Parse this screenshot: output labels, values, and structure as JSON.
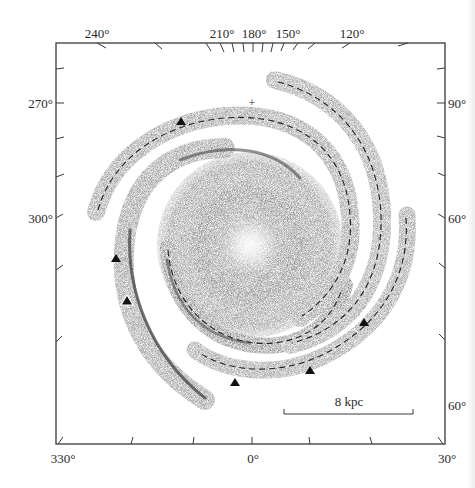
{
  "figure": {
    "title": "",
    "colors": {
      "frame": "#3a3a3a",
      "arm_fill": "#8e8e8e",
      "arm_dark": "#3c3c3c",
      "bulge_center": "#f4f4f4",
      "marker": "#111111",
      "background": "#ffffff"
    },
    "frame": {
      "left": 56,
      "top": 43,
      "right": 445,
      "bottom": 444
    },
    "axis_labels": {
      "top": [
        {
          "text": "240°",
          "x": 97
        },
        {
          "text": "210°",
          "x": 213
        },
        {
          "text": "180°",
          "x": 248
        },
        {
          "text": "150°",
          "x": 286
        },
        {
          "text": "120°",
          "x": 352
        }
      ],
      "left": [
        {
          "text": "270°",
          "y": 103
        },
        {
          "text": "300°",
          "y": 218
        }
      ],
      "right": [
        {
          "text": "90°",
          "y": 103
        },
        {
          "text": "60°",
          "y": 218
        },
        {
          "text": "60°",
          "y": 405
        }
      ],
      "bottom": [
        {
          "text": "330°",
          "x": 62
        },
        {
          "text": "0°",
          "x": 252
        },
        {
          "text": "30°",
          "x": 445
        }
      ]
    },
    "scale_bar": {
      "label": "8 kpc",
      "x1": 284,
      "x2": 413,
      "y": 414
    },
    "sun_marker": {
      "symbol": "+",
      "x": 252,
      "y": 103
    },
    "triangle_markers": [
      {
        "x": 181,
        "y": 122,
        "open": false
      },
      {
        "x": 116,
        "y": 259,
        "open": false
      },
      {
        "x": 127,
        "y": 301,
        "open": true
      },
      {
        "x": 235,
        "y": 383,
        "open": false
      },
      {
        "x": 310,
        "y": 371,
        "open": false
      },
      {
        "x": 364,
        "y": 323,
        "open": false
      }
    ]
  }
}
